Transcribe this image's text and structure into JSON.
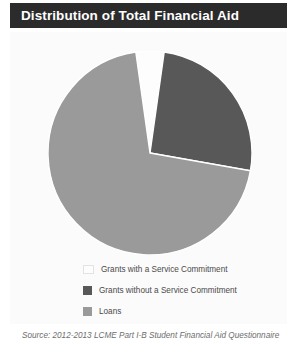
{
  "title": "Distribution of Total Financial Aid",
  "source_note": "Source: 2012-2013 LCME Part I-B Student Financial Aid Questionnaire",
  "colors": {
    "title_bar_bg": "#2b2b2b",
    "title_text": "#ffffff",
    "panel_bg": "#fbfbfb",
    "grants_with_service": "#fdfdfd",
    "grants_without_service": "#585858",
    "loans": "#9a9a9a",
    "slice_stroke": "#ffffff",
    "legend_text": "#4a4a4a",
    "source_text": "#6d6d6d"
  },
  "legend": {
    "items": [
      {
        "label": "Grants with a Service Commitment",
        "color": "#fdfdfd",
        "swatch_name": "legend-swatch-grants-with-service"
      },
      {
        "label": "Grants without a Service Commitment",
        "color": "#585858",
        "swatch_name": "legend-swatch-grants-without-service"
      },
      {
        "label": "Loans",
        "color": "#9a9a9a",
        "swatch_name": "legend-swatch-loans"
      }
    ]
  },
  "chart_data": {
    "type": "pie",
    "title": "Distribution of Total Financial Aid",
    "subtitle": "",
    "xlabel": "",
    "ylabel": "",
    "categories": [
      "Grants with a Service Commitment",
      "Grants without a Service Commitment",
      "Loans"
    ],
    "values": [
      4,
      26,
      70
    ],
    "units": "percent",
    "colors": [
      "#fdfdfd",
      "#585858",
      "#9a9a9a"
    ],
    "start_angle_deg": 352,
    "direction": "clockwise",
    "legend_position": "bottom",
    "grid": false,
    "data_labels_shown": false,
    "slice_angles_deg": [
      {
        "name": "Grants with a Service Commitment",
        "start": 352,
        "end": 8,
        "sweep": 16
      },
      {
        "name": "Grants without a Service Commitment",
        "start": 8,
        "end": 100,
        "sweep": 92
      },
      {
        "name": "Loans",
        "start": 100,
        "end": 352,
        "sweep": 252
      }
    ],
    "geometry": {
      "center_x": 102,
      "center_y": 102,
      "radius": 102
    }
  }
}
